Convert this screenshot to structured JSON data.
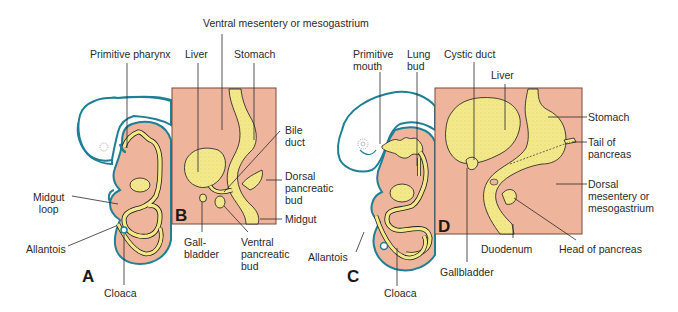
{
  "figure": {
    "colors": {
      "background": "#ffffff",
      "mesoderm": "#eeb59c",
      "endoderm": "#f4e98a",
      "endoderm_stipple": "#8a7d2a",
      "ectoderm_outline": "#1e7f95",
      "box_outline": "#7a4a3a",
      "leader_line": "#2a2a2a",
      "text": "#2a2a2a"
    },
    "panels": [
      {
        "letter": "A",
        "type": "embryo sagittal section"
      },
      {
        "letter": "B",
        "type": "enlarged inset"
      },
      {
        "letter": "C",
        "type": "embryo sagittal section"
      },
      {
        "letter": "D",
        "type": "enlarged inset"
      }
    ],
    "labels": {
      "ventral_mesentery": "Ventral mesentery or mesogastrium",
      "primitive_pharynx": "Primitive pharynx",
      "liver_b": "Liver",
      "stomach_b": "Stomach",
      "bile_duct": "Bile\nduct",
      "dorsal_pancreatic_bud": "Dorsal\npancreatic\nbud",
      "midgut": "Midgut",
      "gallbladder_b": "Gall-\nbladder",
      "ventral_pancreatic_bud": "Ventral\npancreatic\nbud",
      "midgut_loop": "Midgut\n  loop",
      "allantois_a": "Allantois",
      "cloaca_a": "Cloaca",
      "primitive_mouth": "Primitive\nmouth",
      "lung_bud": "Lung\nbud",
      "cystic_duct": "Cystic duct",
      "liver_d": "Liver",
      "stomach_d": "Stomach",
      "tail_of_pancreas": "Tail of\npancreas",
      "dorsal_mesentery": "Dorsal\nmesentery or\nmesogastrium",
      "duodenum": "Duodenum",
      "head_of_pancreas": "Head of pancreas",
      "gallbladder_d": "Gallbladder",
      "allantois_c": "Allantois",
      "cloaca_c": "Cloaca"
    }
  }
}
